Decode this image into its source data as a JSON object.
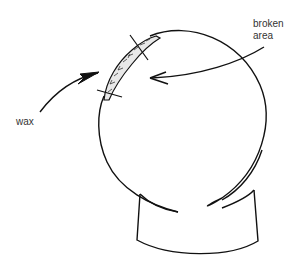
{
  "diagram": {
    "type": "illustration",
    "labels": {
      "wax": "wax",
      "broken_line1": "broken",
      "broken_line2": "area"
    },
    "colors": {
      "stroke": "#111111",
      "text": "#333333",
      "background": "#ffffff"
    }
  }
}
